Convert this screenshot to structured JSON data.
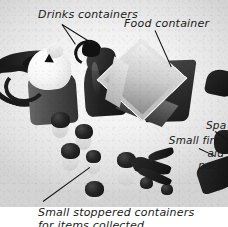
{
  "figure": {
    "kind": "annotated-photograph",
    "medium": "black-and-white photograph",
    "background_color": "#ffffff",
    "ink_color": "#1a1a1a"
  },
  "labels": [
    {
      "id": "drinks-containers",
      "text": "Drinks containers",
      "position": "top-left",
      "leader": "forked two-pronged leader with arrowheads to both bottles"
    },
    {
      "id": "food-container",
      "text": "Food container",
      "position": "top-right",
      "leader": "single diagonal leader down-right to box lid"
    },
    {
      "id": "small-first-aid-pack",
      "text": "Small first aid pack",
      "line_1": "Small first aid",
      "line_2": "pack",
      "position": "middle-right",
      "leader": "short diagonal leader down-right"
    },
    {
      "id": "spare-clipped",
      "text": "Spa",
      "position": "right-edge",
      "note": "label truncated by image edge"
    },
    {
      "id": "small-stoppered-containers",
      "line_1": "Small stoppered containers",
      "line_2": "for items collected",
      "position": "bottom-left",
      "leader": "long diagonal leader up-right to vial cluster"
    }
  ],
  "objects": [
    {
      "id": "canteen-light",
      "name": "light canteen with strap",
      "tone": "light"
    },
    {
      "id": "bottle-dark",
      "name": "dark water bottle with cap ring",
      "tone": "dark"
    },
    {
      "id": "food-box",
      "name": "rectangular food container / tin",
      "tone": "mixed"
    },
    {
      "id": "vial-cluster",
      "name": "small stoppered specimen containers",
      "count": 9,
      "tone": "dark"
    },
    {
      "id": "first-aid-pack",
      "name": "small first aid pack",
      "tone": "dark"
    },
    {
      "id": "shoulder-strap",
      "name": "dark carrying strap",
      "tone": "dark"
    }
  ]
}
